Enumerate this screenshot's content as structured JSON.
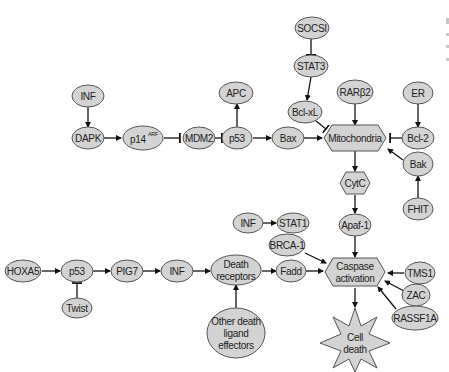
{
  "diagram": {
    "type": "signaling pathway",
    "colors": {
      "node_fill": "#d3d3d3",
      "node_stroke": "#555555",
      "edge": "#111111",
      "text": "#222222"
    },
    "nodes": {
      "socsi": "SOCSI",
      "stat3": "STAT3",
      "apc": "APC",
      "bclxl": "Bcl-xL",
      "rarb2": "RARβ2",
      "er": "ER",
      "inf_top": "INF",
      "dapk": "DAPK",
      "p14": "p14",
      "p14_sup": "ARF",
      "mdm2": "MDM2",
      "p53_top": "p53",
      "bax": "Bax",
      "mito": "Mitochondria",
      "bcl2": "Bcl-2",
      "bak": "Bak",
      "cytc": "CytC",
      "fhit": "FHIT",
      "inf_mid": "INF",
      "stat1": "STAT1",
      "apaf1": "Apaf-1",
      "brca1": "BRCA-1",
      "hoxa5": "HOXA5",
      "p53_bot": "p53",
      "pig7": "PIG7",
      "inf_bot": "INF",
      "death_rec_1": "Death",
      "death_rec_2": "receptors",
      "fadd": "Fadd",
      "caspase_1": "Caspase",
      "caspase_2": "activation",
      "tms1": "TMS1",
      "zac": "ZAC",
      "rassf1a": "RASSF1A",
      "twist": "Twist",
      "other_1": "Other death",
      "other_2": "ligand",
      "other_3": "effectors",
      "celldeath_1": "Cell",
      "celldeath_2": "death"
    },
    "edges": [
      {
        "from": "SOCSI",
        "to": "STAT3",
        "type": "inhibit"
      },
      {
        "from": "STAT3",
        "to": "Bcl-xL",
        "type": "activate"
      },
      {
        "from": "Bcl-xL",
        "to": "Mitochondria",
        "type": "inhibit"
      },
      {
        "from": "p53",
        "to": "APC",
        "type": "activate"
      },
      {
        "from": "INF",
        "to": "DAPK",
        "type": "activate"
      },
      {
        "from": "DAPK",
        "to": "p14ARF",
        "type": "activate"
      },
      {
        "from": "p14ARF",
        "to": "MDM2",
        "type": "inhibit"
      },
      {
        "from": "MDM2",
        "to": "p53",
        "type": "inhibit"
      },
      {
        "from": "p53",
        "to": "Bax",
        "type": "activate"
      },
      {
        "from": "Bax",
        "to": "Mitochondria",
        "type": "activate"
      },
      {
        "from": "RARβ2",
        "to": "Mitochondria",
        "type": "activate"
      },
      {
        "from": "ER",
        "to": "Bcl-2",
        "type": "activate"
      },
      {
        "from": "Bcl-2",
        "to": "Mitochondria",
        "type": "inhibit"
      },
      {
        "from": "Bak",
        "to": "Mitochondria",
        "type": "activate"
      },
      {
        "from": "FHIT",
        "to": "Bak",
        "type": "activate"
      },
      {
        "from": "Mitochondria",
        "to": "CytC",
        "type": "activate"
      },
      {
        "from": "CytC",
        "to": "Apaf-1",
        "type": "activate"
      },
      {
        "from": "Apaf-1",
        "to": "Caspase activation",
        "type": "activate"
      },
      {
        "from": "INF",
        "to": "STAT1",
        "type": "activate"
      },
      {
        "from": "BRCA-1",
        "to": "Caspase activation",
        "type": "activate"
      },
      {
        "from": "HOXA5",
        "to": "p53",
        "type": "activate"
      },
      {
        "from": "Twist",
        "to": "p53",
        "type": "inhibit"
      },
      {
        "from": "p53",
        "to": "PIG7",
        "type": "activate"
      },
      {
        "from": "PIG7",
        "to": "INF",
        "type": "activate"
      },
      {
        "from": "INF",
        "to": "Death receptors",
        "type": "activate"
      },
      {
        "from": "Other death ligand effectors",
        "to": "Death receptors",
        "type": "activate"
      },
      {
        "from": "Death receptors",
        "to": "Fadd",
        "type": "activate"
      },
      {
        "from": "Fadd",
        "to": "Caspase activation",
        "type": "activate"
      },
      {
        "from": "TMS1",
        "to": "Caspase activation",
        "type": "activate"
      },
      {
        "from": "ZAC",
        "to": "Caspase activation",
        "type": "activate"
      },
      {
        "from": "RASSF1A",
        "to": "Caspase activation",
        "type": "activate"
      },
      {
        "from": "Caspase activation",
        "to": "Cell death",
        "type": "activate"
      }
    ]
  }
}
